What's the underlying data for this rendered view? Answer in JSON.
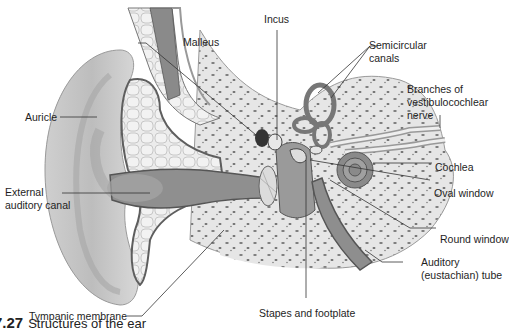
{
  "figure": {
    "title": "Structures of the ear",
    "caption_number": "7.27",
    "caption_text": "Structures of the ear",
    "colors": {
      "skin": "#d6d6d6",
      "skin_dark": "#a8a8a8",
      "canal": "#8e8e8e",
      "bone": "#e4e4e4",
      "bone_spots": "#6e6e6e",
      "cartilage": "#e8e8e8",
      "outline": "#5a5a5a",
      "leader": "#333333"
    }
  },
  "labels": {
    "auricle": "Auricle",
    "external_canal_line1": "External",
    "external_canal_line2": "auditory canal",
    "tympanic": "Tympanic membrane",
    "malleus": "Malleus",
    "incus": "Incus",
    "semicircular_line1": "Semicircular",
    "semicircular_line2": "canals",
    "branches_line1": "Branches of",
    "branches_line2": "vestibulocochlear",
    "branches_line3": "nerve",
    "cochlea": "Cochlea",
    "oval_window": "Oval window",
    "round_window": "Round window",
    "auditory_tube_line1": "Auditory",
    "auditory_tube_line2": "(eustachian) tube",
    "stapes": "Stapes and footplate"
  }
}
